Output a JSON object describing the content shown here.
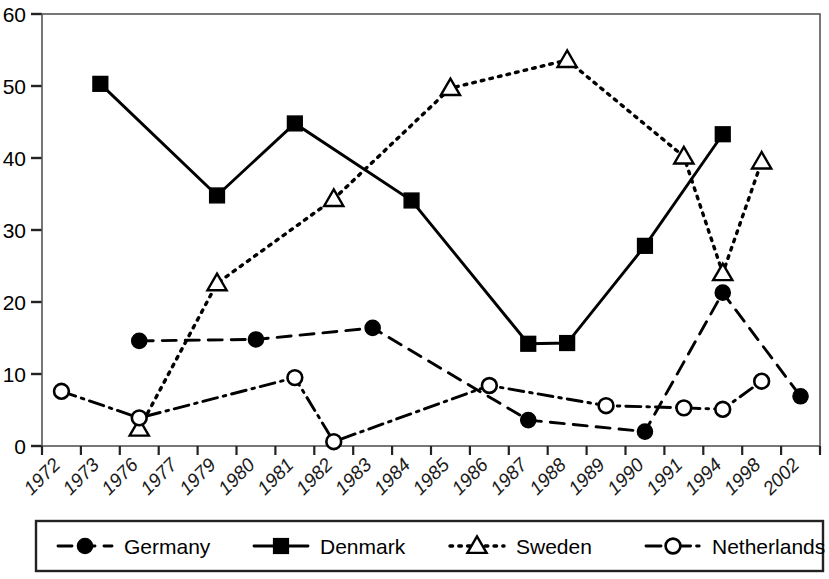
{
  "chart_data": {
    "type": "line",
    "title": "",
    "xlabel": "",
    "ylabel": "",
    "ylim": [
      0,
      60
    ],
    "yticks": [
      0,
      10,
      20,
      30,
      40,
      50,
      60
    ],
    "grid": false,
    "legend_position": "bottom",
    "categories": [
      "1972",
      "1973",
      "1976",
      "1977",
      "1979",
      "1980",
      "1981",
      "1982",
      "1983",
      "1984",
      "1985",
      "1986",
      "1987",
      "1988",
      "1989",
      "1990",
      "1991",
      "1994",
      "1998",
      "2002"
    ],
    "series": [
      {
        "name": "Germany",
        "marker": "filled-circle",
        "line_style": "dashed",
        "color": "#000000",
        "values": [
          null,
          null,
          14.6,
          null,
          null,
          14.8,
          null,
          null,
          16.4,
          null,
          null,
          null,
          3.6,
          null,
          null,
          2.0,
          null,
          21.3,
          null,
          6.9
        ]
      },
      {
        "name": "Denmark",
        "marker": "filled-square",
        "line_style": "solid",
        "color": "#000000",
        "values": [
          null,
          50.3,
          null,
          null,
          34.8,
          null,
          44.8,
          null,
          null,
          34.1,
          null,
          null,
          14.2,
          14.3,
          null,
          27.8,
          null,
          43.3,
          null,
          null
        ]
      },
      {
        "name": "Sweden",
        "marker": "open-triangle",
        "line_style": "dotted",
        "color": "#000000",
        "values": [
          null,
          null,
          2.4,
          null,
          22.6,
          null,
          null,
          34.3,
          null,
          null,
          49.7,
          null,
          null,
          53.6,
          null,
          null,
          40.2,
          24.0,
          39.5,
          null
        ]
      },
      {
        "name": "Netherlands",
        "marker": "open-circle",
        "line_style": "dash-dot",
        "color": "#000000",
        "values": [
          7.6,
          null,
          3.9,
          null,
          null,
          null,
          9.5,
          0.6,
          null,
          null,
          null,
          8.4,
          null,
          null,
          5.6,
          null,
          5.3,
          5.1,
          9.0,
          null
        ]
      }
    ]
  },
  "legend": {
    "items": [
      {
        "label": "Germany",
        "marker": "filled-circle",
        "line_style": "dashed"
      },
      {
        "label": "Denmark",
        "marker": "filled-square",
        "line_style": "solid"
      },
      {
        "label": "Sweden",
        "marker": "open-triangle",
        "line_style": "dotted"
      },
      {
        "label": "Netherlands",
        "marker": "open-circle",
        "line_style": "dash-dot"
      }
    ]
  }
}
